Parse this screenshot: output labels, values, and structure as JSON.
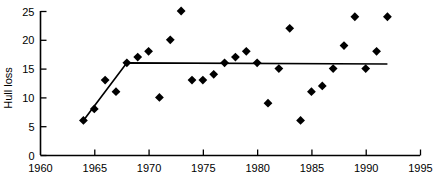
{
  "chart_data": {
    "type": "scatter",
    "title": "",
    "xlabel": "",
    "ylabel": "Hull loss",
    "xlim": [
      1960,
      1995
    ],
    "ylim": [
      0,
      25
    ],
    "grid": false,
    "legend": null,
    "xticks": [
      1960,
      1965,
      1970,
      1975,
      1980,
      1985,
      1990,
      1995
    ],
    "yticks": [
      0,
      5,
      10,
      15,
      20,
      25
    ],
    "xtick_labels": [
      "1960",
      "1965",
      "1970",
      "1975",
      "1980",
      "1985",
      "1990",
      "1995"
    ],
    "ytick_labels": [
      "0",
      "5",
      "10",
      "15",
      "20",
      "25"
    ],
    "series": [
      {
        "name": "Hull loss",
        "marker": "diamond",
        "color": "#000000",
        "points": [
          {
            "x": 1964,
            "y": 6
          },
          {
            "x": 1965,
            "y": 8
          },
          {
            "x": 1966,
            "y": 13
          },
          {
            "x": 1967,
            "y": 11
          },
          {
            "x": 1968,
            "y": 16
          },
          {
            "x": 1969,
            "y": 17
          },
          {
            "x": 1970,
            "y": 18
          },
          {
            "x": 1971,
            "y": 10
          },
          {
            "x": 1972,
            "y": 20
          },
          {
            "x": 1973,
            "y": 25
          },
          {
            "x": 1974,
            "y": 13
          },
          {
            "x": 1975,
            "y": 13
          },
          {
            "x": 1976,
            "y": 14
          },
          {
            "x": 1977,
            "y": 16
          },
          {
            "x": 1978,
            "y": 17
          },
          {
            "x": 1979,
            "y": 18
          },
          {
            "x": 1980,
            "y": 16
          },
          {
            "x": 1981,
            "y": 9
          },
          {
            "x": 1982,
            "y": 15
          },
          {
            "x": 1983,
            "y": 22
          },
          {
            "x": 1984,
            "y": 6
          },
          {
            "x": 1985,
            "y": 11
          },
          {
            "x": 1986,
            "y": 12
          },
          {
            "x": 1987,
            "y": 15
          },
          {
            "x": 1988,
            "y": 19
          },
          {
            "x": 1989,
            "y": 24
          },
          {
            "x": 1990,
            "y": 15
          },
          {
            "x": 1991,
            "y": 18
          },
          {
            "x": 1992,
            "y": 24
          }
        ]
      }
    ],
    "annotations": [
      {
        "name": "piecewise-trend-line",
        "type": "line",
        "color": "#000000",
        "points": [
          {
            "x": 1964,
            "y": 6
          },
          {
            "x": 1968,
            "y": 16
          },
          {
            "x": 1992,
            "y": 15.8
          }
        ]
      }
    ]
  }
}
